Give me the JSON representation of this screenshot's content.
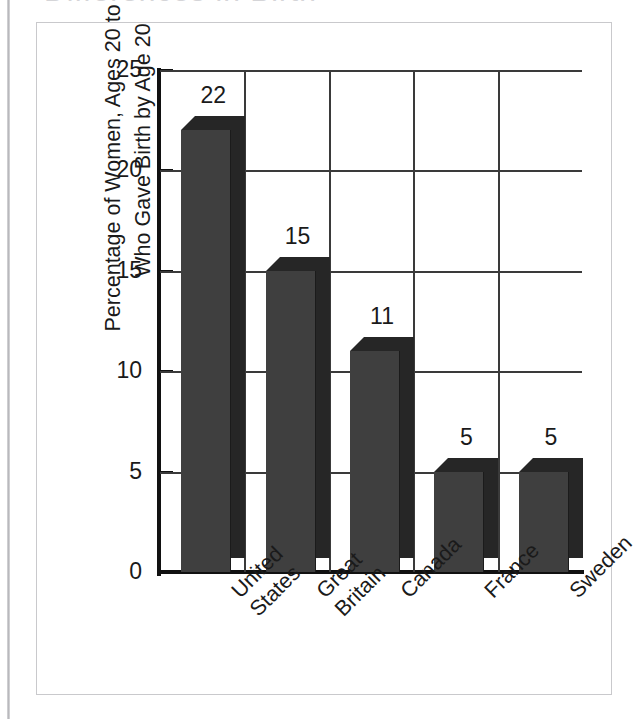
{
  "page": {
    "title_fragment_ghost": "Differences in Birth",
    "background_color": "#ffffff"
  },
  "chart_data": {
    "type": "bar",
    "title": "",
    "categories": [
      "United States",
      "Great Britain",
      "Canada",
      "France",
      "Sweden"
    ],
    "category_lines": [
      [
        "United",
        "States"
      ],
      [
        "Great",
        "Britain"
      ],
      [
        "Canada"
      ],
      [
        "France"
      ],
      [
        "Sweden"
      ]
    ],
    "values": [
      22,
      15,
      11,
      5,
      5
    ],
    "data_labels": [
      "22",
      "15",
      "11",
      "5",
      "5"
    ],
    "xlabel": "",
    "ylabel": "Percentage of Women, Ages 20 to 24, Who Gave Birth by Age 20",
    "ylabel_lines": [
      "Percentage of Women, Ages 20 to 24,",
      "Who Gave Birth by Age 20"
    ],
    "ylim": [
      0,
      25
    ],
    "ytick_labels": [
      "0",
      "5",
      "10",
      "15",
      "20",
      "25"
    ],
    "ytick_values": [
      0,
      5,
      10,
      15,
      20,
      25
    ],
    "grid": true,
    "grid_orientation": "both",
    "legend": false,
    "style": "3d-column",
    "colors": {
      "bar_front": "#3f3f3f",
      "bar_shade": "#262626",
      "axis": "#111111",
      "gridline": "#3a3a3a",
      "frame": "#c9c9cc",
      "text": "#1a1a1a"
    }
  }
}
